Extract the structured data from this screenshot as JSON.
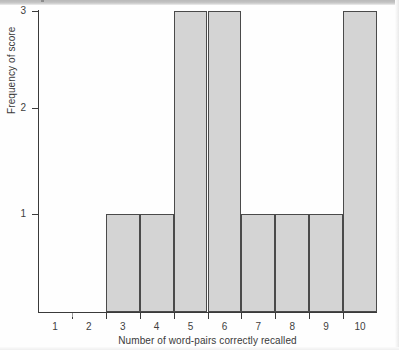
{
  "chart_data": {
    "type": "bar",
    "title": "",
    "subtitle": "",
    "xlabel": "Number of word-pairs correctly recalled",
    "ylabel": "Frequency of score",
    "categories": [
      "1",
      "2",
      "3",
      "4",
      "5",
      "6",
      "7",
      "8",
      "9",
      "10"
    ],
    "bins": [
      {
        "label": "2-3",
        "left": 2,
        "right": 3,
        "value": 1
      },
      {
        "label": "3-4",
        "left": 3,
        "right": 4,
        "value": 1
      },
      {
        "label": "4-5",
        "left": 4,
        "right": 5,
        "value": 3
      },
      {
        "label": "5-6",
        "left": 5,
        "right": 6,
        "value": 3
      },
      {
        "label": "6-7",
        "left": 6,
        "right": 7,
        "value": 1
      },
      {
        "label": "7-8",
        "left": 7,
        "right": 8,
        "value": 1
      },
      {
        "label": "8-9",
        "left": 8,
        "right": 9,
        "value": 1
      },
      {
        "label": "9-10",
        "left": 9,
        "right": 10,
        "value": 3
      }
    ],
    "values": [
      0,
      0,
      1,
      1,
      3,
      3,
      1,
      1,
      1,
      3
    ],
    "x_tick_labels": [
      "1",
      "2",
      "3",
      "4",
      "5",
      "6",
      "7",
      "8",
      "9",
      "10"
    ],
    "y_tick_labels": [
      "1",
      "2",
      "3"
    ],
    "y_ticks": [
      1,
      2,
      3
    ],
    "ylim": [
      0,
      3
    ],
    "xlim": [
      0.5,
      10.5
    ],
    "grid": false,
    "legend": null,
    "legend_position": "none",
    "bar_fill_color": "#d4d4d4",
    "bar_border_color": "#4a4a4a",
    "axis_color": "#3a3a3a",
    "background_color": "#fefefe"
  },
  "axes": {
    "y_label": "Frequency of score",
    "x_label": "Number of word-pairs correctly recalled"
  }
}
